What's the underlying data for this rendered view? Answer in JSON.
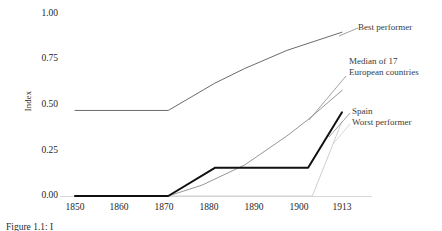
{
  "chart_data": {
    "type": "line",
    "title": "",
    "subtitle": "",
    "xlabel": "",
    "ylabel": "Index",
    "xlim": [
      1850,
      1913
    ],
    "ylim": [
      0.0,
      1.0
    ],
    "grid": false,
    "legend_position": "right-inline-annotations",
    "x_ticks": [
      "1850",
      "1860",
      "1870",
      "1880",
      "1890",
      "1900",
      "1913"
    ],
    "x_tick_values": [
      1850,
      1860,
      1870,
      1880,
      1890,
      1900,
      1913
    ],
    "y_ticks": [
      "0.00",
      "0.25",
      "0.50",
      "0.75",
      "1.00"
    ],
    "y_tick_values": [
      0.0,
      0.25,
      0.5,
      0.75,
      1.0
    ],
    "series": [
      {
        "name": "Best performer",
        "color": "#6b6b6b",
        "width": 1.0,
        "x": [
          1850,
          1872,
          1883,
          1890,
          1900,
          1913
        ],
        "values": [
          0.47,
          0.47,
          0.62,
          0.7,
          0.8,
          0.9
        ]
      },
      {
        "name": "Median of 17 European countries",
        "color": "#8a8a8a",
        "width": 0.9,
        "x": [
          1850,
          1872,
          1880,
          1890,
          1900,
          1905,
          1913
        ],
        "values": [
          0.0,
          0.0,
          0.06,
          0.17,
          0.33,
          0.42,
          0.58
        ]
      },
      {
        "name": "Spain",
        "color": "#111111",
        "width": 2.0,
        "x": [
          1850,
          1872,
          1883,
          1905,
          1913
        ],
        "values": [
          0.0,
          0.0,
          0.155,
          0.155,
          0.46
        ]
      },
      {
        "name": "Worst performer",
        "color": "#cfcfcf",
        "width": 1.0,
        "x": [
          1850,
          1906,
          1913
        ],
        "values": [
          0.0,
          0.0,
          0.41
        ]
      }
    ],
    "annotations": [
      {
        "text": "Best performer",
        "series": "Best performer"
      },
      {
        "text": "Median of 17",
        "series": "Median of 17 European countries"
      },
      {
        "text": "European countries",
        "series": "Median of 17 European countries"
      },
      {
        "text": "Spain",
        "series": "Spain"
      },
      {
        "text": "Worst performer",
        "series": "Worst performer"
      }
    ]
  },
  "axis": {
    "y_label": "Index",
    "y_ticks": [
      {
        "label": "1.00"
      },
      {
        "label": "0.75"
      },
      {
        "label": "0.50"
      },
      {
        "label": "0.25"
      },
      {
        "label": "0.00"
      }
    ],
    "x_ticks": [
      {
        "label": "1850"
      },
      {
        "label": "1860"
      },
      {
        "label": "1870"
      },
      {
        "label": "1880"
      },
      {
        "label": "1890"
      },
      {
        "label": "1900"
      },
      {
        "label": "1913"
      }
    ]
  },
  "annotations": {
    "best_performer": "Best performer",
    "median_line1": "Median of 17",
    "median_line2": "European countries",
    "spain": "Spain",
    "worst_performer": "Worst performer"
  },
  "caption": {
    "text": "Figure 1.1: I"
  },
  "colors": {
    "best_performer": "#6b6b6b",
    "median": "#8a8a8a",
    "spain": "#111111",
    "worst_performer": "#cfcfcf",
    "text": "#2b2b2b",
    "background": "#ffffff"
  }
}
